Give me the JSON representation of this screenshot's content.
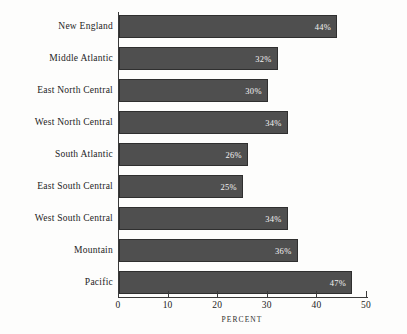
{
  "chart_data": {
    "type": "bar",
    "orientation": "horizontal",
    "title": "",
    "xlabel": "PERCENT",
    "ylabel": "",
    "categories": [
      "New England",
      "Middle Atlantic",
      "East North Central",
      "West North Central",
      "South Atlantic",
      "East South Central",
      "West South Central",
      "Mountain",
      "Pacific"
    ],
    "values": [
      44,
      32,
      30,
      34,
      26,
      25,
      34,
      36,
      47
    ],
    "value_labels": [
      "44%",
      "32%",
      "30%",
      "34%",
      "26%",
      "25%",
      "34%",
      "36%",
      "47%"
    ],
    "xlim": [
      0,
      54
    ],
    "xticks": [
      0,
      10,
      20,
      30,
      40,
      50
    ],
    "xtick_labels": [
      "0",
      "10",
      "20",
      "30",
      "40",
      "50"
    ],
    "grid": false,
    "legend": null,
    "bar_color": "#4f4f4f",
    "bar_edge_color": "#2f2f2f",
    "value_label_color": "#f2f2f2",
    "axis_color": "#3a3a3a",
    "background_color": "#fdfdfc"
  }
}
